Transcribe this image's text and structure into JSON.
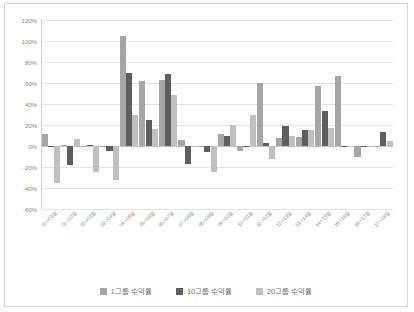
{
  "chart": {
    "type": "bar",
    "title": "",
    "background": "#ffffff",
    "border_color": "#d4d4d4"
  },
  "chart_data": {
    "type": "bar",
    "title": "",
    "subtitle": "",
    "xlabel": "",
    "ylabel": "",
    "ylim": [
      -60,
      120
    ],
    "ytick_step": 20,
    "ytick_labels": [
      "120%",
      "100%",
      "80%",
      "60%",
      "40%",
      "20%",
      "0%",
      "-20%",
      "-40%",
      "-60%"
    ],
    "ytick_values": [
      120,
      100,
      80,
      60,
      40,
      20,
      0,
      -20,
      -40,
      -60
    ],
    "grid": true,
    "grid_axis": "y",
    "legend_position": "bottom",
    "categories": [
      "00->01월",
      "01->02월",
      "02->03월",
      "03->04월",
      "04->05월",
      "05->06월",
      "06->07월",
      "07->08월",
      "08->09월",
      "09->10월",
      "10->11월",
      "11->12월",
      "12->13월",
      "13->14월",
      "14->15월",
      "15->16월",
      "16->17월",
      "17->18월"
    ],
    "series": [
      {
        "name": "1그룹 수익률",
        "color": "#a6a6a6",
        "values": [
          11.3,
          0.7,
          -0.3,
          -0.6,
          105.0,
          61.8,
          63.0,
          5.8,
          -0.4,
          11.4,
          -4.5,
          59.8,
          8.0,
          8.6,
          56.7,
          66.2,
          -10.8,
          0.4
        ]
      },
      {
        "name": "10그룹 수익률",
        "color": "#5e5e5e",
        "values": [
          -0.8,
          -17.8,
          0.5,
          -4.6,
          69.4,
          24.8,
          68.3,
          -17.5,
          -5.6,
          9.6,
          0.4,
          3.0,
          19.3,
          14.8,
          33.5,
          -0.5,
          0.3,
          13.7
        ]
      },
      {
        "name": "20그룹 수익률",
        "color": "#c0c0c0",
        "values": [
          -35.3,
          6.6,
          -25.0,
          -32.1,
          29.3,
          16.2,
          48.9,
          -0.5,
          -24.3,
          20.2,
          29.2,
          -12.5,
          9.9,
          15.0,
          16.8,
          -0.4,
          0.2,
          4.6
        ]
      }
    ]
  },
  "legend": {
    "items": [
      {
        "label": "1그룹 수익률",
        "color": "#a6a6a6"
      },
      {
        "label": "10그룹 수익률",
        "color": "#5e5e5e"
      },
      {
        "label": "20그룹 수익률",
        "color": "#c0c0c0"
      }
    ]
  }
}
